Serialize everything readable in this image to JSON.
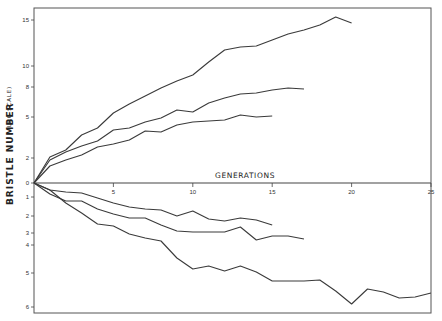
{
  "chart_data": {
    "type": "line",
    "title": "",
    "xlabel": "GENERATIONS",
    "ylabel": "BRISTLE NUMBER",
    "ylabel_note": "(LOG SCALE)",
    "x_ticks": [
      "5",
      "10",
      "15",
      "20",
      "25"
    ],
    "xlim": [
      0,
      25
    ],
    "y_ticks_upper": [
      "15",
      "10",
      "8",
      "5",
      "2",
      "0"
    ],
    "y_ticks_lower": [
      "1",
      "2",
      "3",
      "4",
      "5",
      "6"
    ],
    "grid": false,
    "legend": "none",
    "pixel_mapping": {
      "x0": 34,
      "px_per_generation": 15.88,
      "zero_y": 183,
      "upper_ticks_y": {
        "15": 20,
        "10": 66,
        "8": 87,
        "5": 117,
        "2": 158,
        "0": 183
      },
      "lower_ticks_y": {
        "1": 197,
        "2": 216,
        "3": 233,
        "4": 245,
        "5": 273,
        "6": 307
      }
    },
    "series": [
      {
        "name": "upward selection line A",
        "direction": "up",
        "generations": [
          0,
          1,
          2,
          3,
          4,
          5,
          6,
          7,
          8,
          9,
          10,
          11,
          12,
          13,
          14,
          15,
          16,
          17,
          18,
          19,
          20
        ],
        "pixel_y": [
          183,
          157,
          150,
          135,
          128,
          113,
          104,
          96,
          88,
          81,
          75,
          62,
          50,
          47,
          46,
          40,
          34,
          30,
          25,
          17,
          23
        ]
      },
      {
        "name": "upward selection line B",
        "direction": "up",
        "generations": [
          0,
          1,
          2,
          3,
          4,
          5,
          6,
          7,
          8,
          9,
          10,
          11,
          12,
          13,
          14,
          15,
          16,
          17
        ],
        "pixel_y": [
          183,
          160,
          152,
          146,
          141,
          130,
          128,
          122,
          118,
          110,
          112,
          103,
          98,
          94,
          93,
          90,
          88,
          89
        ]
      },
      {
        "name": "upward selection line C",
        "direction": "up",
        "generations": [
          0,
          1,
          2,
          3,
          4,
          5,
          6,
          7,
          8,
          9,
          10,
          11,
          12,
          13,
          14,
          15
        ],
        "pixel_y": [
          183,
          166,
          160,
          155,
          147,
          144,
          140,
          131,
          132,
          125,
          122,
          121,
          120,
          115,
          117,
          116
        ]
      },
      {
        "name": "downward selection line A",
        "direction": "down",
        "generations": [
          0,
          1,
          2,
          3,
          4,
          5,
          6,
          7,
          8,
          9,
          10,
          11,
          12,
          13,
          14,
          15
        ],
        "pixel_y": [
          183,
          190,
          192,
          193,
          198,
          203,
          207,
          209,
          210,
          216,
          211,
          219,
          221,
          218,
          220,
          225
        ]
      },
      {
        "name": "downward selection line B",
        "direction": "down",
        "generations": [
          0,
          1,
          2,
          3,
          4,
          5,
          6,
          7,
          8,
          9,
          10,
          11,
          12,
          13,
          14,
          15,
          16,
          17
        ],
        "pixel_y": [
          183,
          194,
          201,
          201,
          209,
          214,
          218,
          218,
          225,
          231,
          232,
          232,
          232,
          227,
          240,
          236,
          236,
          239
        ]
      },
      {
        "name": "downward selection line C",
        "direction": "down",
        "generations": [
          0,
          1,
          2,
          3,
          4,
          5,
          6,
          7,
          8,
          9,
          10,
          11,
          12,
          13,
          14,
          15,
          16,
          17,
          18,
          19,
          20,
          21,
          22,
          23,
          24,
          25
        ],
        "pixel_y": [
          183,
          190,
          203,
          213,
          224,
          226,
          234,
          238,
          241,
          258,
          269,
          266,
          271,
          266,
          272,
          281,
          281,
          281,
          280,
          291,
          304,
          289,
          292,
          298,
          297,
          293
        ]
      }
    ]
  },
  "style": {
    "line_color": "#3a3a3a",
    "frame_color": "#444444"
  }
}
